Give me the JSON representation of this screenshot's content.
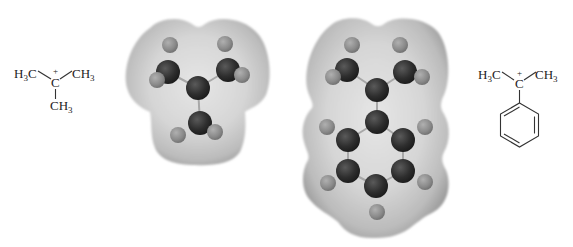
{
  "figure": {
    "colors": {
      "background": "#ffffff",
      "surface_light": "#e4e4e4",
      "surface_mid": "#c9c9c9",
      "surface_dark": "#9a9a9a",
      "carbon": "#2c2c2c",
      "hydrogen": "#8c8c8c",
      "text": "#222222"
    }
  },
  "left_structure": {
    "name": "tert-butyl cation",
    "center_atom": "C",
    "charge": "+",
    "groups": {
      "upper_left": {
        "main": "H",
        "sub": "3",
        "tail": "C"
      },
      "upper_right": {
        "main": "CH",
        "sub": "3"
      },
      "bottom": {
        "main": "CH",
        "sub": "3"
      }
    }
  },
  "right_structure": {
    "name": "cumyl cation",
    "center_atom": "C",
    "charge": "+",
    "groups": {
      "upper_left": {
        "main": "H",
        "sub": "3",
        "tail": "C"
      },
      "upper_right": {
        "main": "CH",
        "sub": "3"
      },
      "bottom": "benzene ring"
    }
  },
  "models": [
    {
      "name": "tert-butyl cation electrostatic potential model",
      "carbons": [
        [
          198,
          88
        ],
        [
          168,
          72
        ],
        [
          228,
          70
        ],
        [
          200,
          123
        ]
      ],
      "hydrogens": [
        [
          170,
          45
        ],
        [
          157,
          80
        ],
        [
          225,
          44
        ],
        [
          242,
          75
        ],
        [
          178,
          135
        ],
        [
          215,
          132
        ]
      ]
    },
    {
      "name": "cumyl cation electrostatic potential model",
      "carbons": [
        [
          377,
          90
        ],
        [
          347,
          70
        ],
        [
          405,
          72
        ],
        [
          377,
          122
        ],
        [
          348,
          140
        ],
        [
          403,
          140
        ],
        [
          348,
          171
        ],
        [
          403,
          171
        ],
        [
          376,
          186
        ]
      ],
      "hydrogens": [
        [
          352,
          45
        ],
        [
          333,
          77
        ],
        [
          400,
          45
        ],
        [
          422,
          77
        ],
        [
          327,
          127
        ],
        [
          425,
          127
        ],
        [
          328,
          183
        ],
        [
          425,
          182
        ],
        [
          377,
          212
        ]
      ]
    }
  ]
}
